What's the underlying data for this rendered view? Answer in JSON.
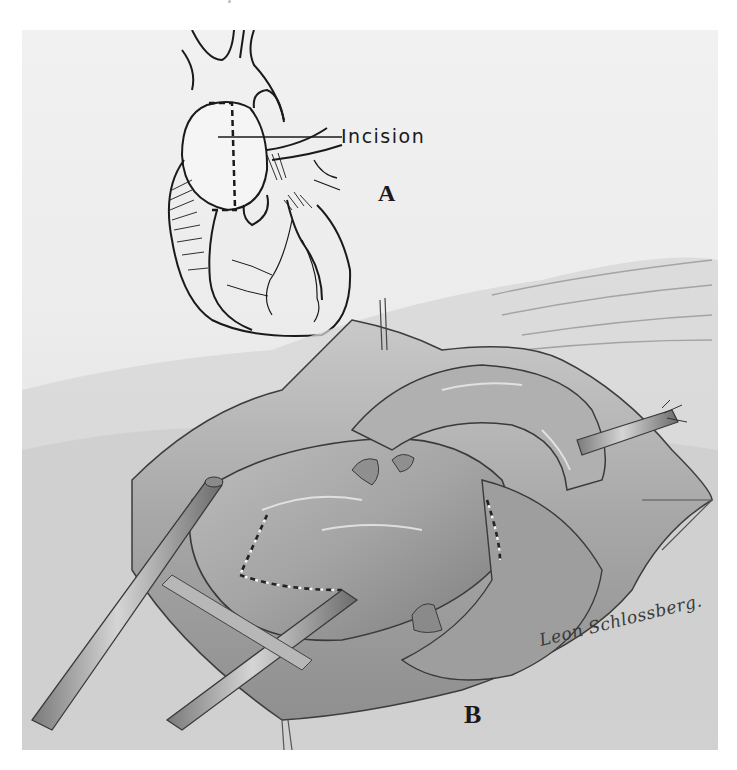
{
  "figure": {
    "panels": [
      {
        "id": "A",
        "label": "A",
        "description": "Line drawing of heart with dashed incision line on aorta",
        "callout": "Incision"
      },
      {
        "id": "B",
        "label": "B",
        "description": "Shaded surgical field view with cannulas, dashed incision lines, and sutures"
      }
    ],
    "signature": "Leon Schlossberg.",
    "colors": {
      "background": "#ffffff",
      "plate": "#ececec",
      "ink": "#1a1a1a",
      "shade_dark": "#6e6e6e",
      "shade_mid": "#9a9a9a",
      "shade_light": "#c8c8c8"
    }
  }
}
